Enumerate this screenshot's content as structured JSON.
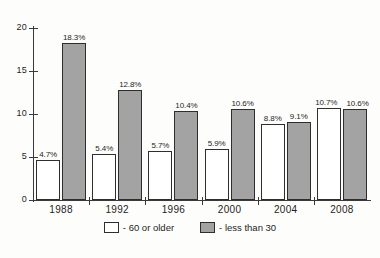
{
  "chart_data": {
    "type": "bar",
    "title": "",
    "subtitle": "",
    "xlabel": "",
    "ylabel": "",
    "ylim": [
      0,
      20
    ],
    "yticks": [
      "0",
      "5",
      "10",
      "15",
      "20"
    ],
    "grid": false,
    "legend_position": "bottom-center",
    "categories": [
      "1988",
      "1992",
      "1996",
      "2000",
      "2004",
      "2008"
    ],
    "series": [
      {
        "name": "- 60 or older",
        "swatch": "light",
        "color": "#ffffff",
        "values": [
          4.7,
          5.4,
          5.7,
          5.9,
          8.8,
          10.7
        ],
        "labels": [
          "4.7%",
          "5.4%",
          "5.7%",
          "5.9%",
          "8.8%",
          "10.7%"
        ]
      },
      {
        "name": "- less than 30",
        "swatch": "dark",
        "color": "#a3a3a3",
        "values": [
          18.3,
          12.8,
          10.4,
          10.6,
          9.1,
          10.6
        ],
        "labels": [
          "18.3%",
          "12.8%",
          "10.4%",
          "10.6%",
          "9.1%",
          "10.6%"
        ]
      }
    ]
  },
  "axes": {
    "y_ticks": [
      {
        "label": "20",
        "value": 20
      },
      {
        "label": "15",
        "value": 15
      },
      {
        "label": "10",
        "value": 10
      },
      {
        "label": "5",
        "value": 5
      },
      {
        "label": "0",
        "value": 0
      }
    ],
    "x_ticks": [
      {
        "label": "1988"
      },
      {
        "label": "1992"
      },
      {
        "label": "1996"
      },
      {
        "label": "2000"
      },
      {
        "label": "2004"
      },
      {
        "label": "2008"
      }
    ]
  },
  "legend": {
    "items": [
      {
        "label": "- 60 or older",
        "swatch": "light"
      },
      {
        "label": "- less than 30",
        "swatch": "dark"
      }
    ]
  },
  "caption": {
    "text": ""
  },
  "colors": {
    "bar_light": "#ffffff",
    "bar_dark": "#a3a3a3",
    "bar_border": "#2e2e2e",
    "axis": "#3a3a3a",
    "text": "#1d1d1d",
    "background": "#fdfdfb"
  }
}
